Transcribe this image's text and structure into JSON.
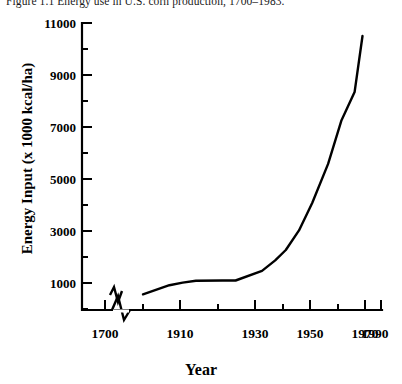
{
  "figure": {
    "caption": "Figure 1.1  Energy use in U.S. corn production, 1700–1983."
  },
  "chart_data": {
    "type": "line",
    "title": "Figure 1.1  Energy use in U.S. corn production, 1700–1983.",
    "xlabel": "Year",
    "ylabel": "Energy Input (x 1000 kcal/ha)",
    "xlim": [
      1700,
      1990
    ],
    "ylim": [
      0,
      11000
    ],
    "grid": false,
    "legend": null,
    "axis_break": {
      "axis": "x",
      "after": 1700,
      "note": "zigzag break between 1700 and 1900"
    },
    "x_major_ticks": [
      1700,
      1910,
      1930,
      1950,
      1970,
      1990
    ],
    "x_tick_labels": [
      "1700",
      "1910",
      "1930",
      "1950",
      "1970",
      "1990"
    ],
    "x_minor_ticks": [
      1900,
      1920,
      1940,
      1960,
      1980
    ],
    "y_major_ticks": [
      1000,
      3000,
      5000,
      7000,
      9000,
      11000
    ],
    "y_tick_labels": [
      "1000",
      "3000",
      "5000",
      "7000",
      "9000",
      "11000"
    ],
    "y_minor_ticks": [
      2000,
      4000,
      6000,
      8000,
      10000
    ],
    "series": [
      {
        "name": "Energy input in U.S. corn production",
        "color": "#000000",
        "x": [
          1700,
          1750,
          1900,
          1910,
          1915,
          1920,
          1930,
          1935,
          1945,
          1950,
          1954,
          1959,
          1964,
          1970,
          1975,
          1980,
          1983
        ],
        "values": [
          330,
          480,
          600,
          950,
          1050,
          1120,
          1130,
          1130,
          1500,
          1900,
          2300,
          3050,
          4100,
          5600,
          7250,
          8350,
          10500
        ]
      }
    ]
  },
  "axes": {
    "y_labels": [
      "11000",
      "9000",
      "7000",
      "5000",
      "3000",
      "1000"
    ],
    "x_labels": [
      "1700",
      "1910",
      "1930",
      "1950",
      "1970",
      "1990"
    ]
  }
}
